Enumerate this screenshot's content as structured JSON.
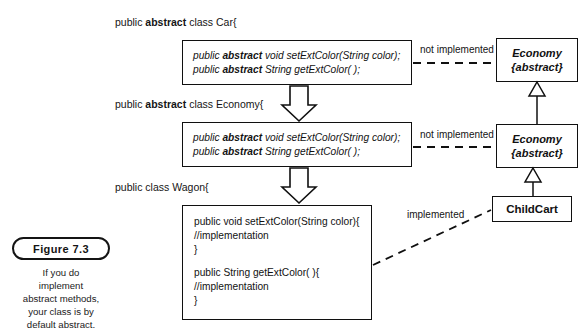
{
  "figure": {
    "badge_label": "Figure 7.3",
    "caption_lines": [
      "If you do",
      "implement",
      "abstract methods,",
      "your class is by",
      "default abstract."
    ]
  },
  "declarations": {
    "car": {
      "prefix": "public ",
      "keyword": "abstract",
      "suffix": " class Car{"
    },
    "economy": {
      "prefix": "public ",
      "keyword": "abstract",
      "suffix": " class Economy{"
    },
    "wagon": {
      "prefix": "public class Wagon{",
      "keyword": "",
      "suffix": ""
    }
  },
  "code_blocks": [
    {
      "id": "car-body",
      "lines": [
        {
          "pre": "public ",
          "bold": "abstract",
          "post": " void setExtColor(String color);"
        },
        {
          "pre": "public ",
          "bold": "abstract",
          "post": " String getExtColor( );"
        }
      ]
    },
    {
      "id": "economy-body",
      "lines": [
        {
          "pre": "public ",
          "bold": "abstract",
          "post": " void setExtColor(String color);"
        },
        {
          "pre": "public ",
          "bold": "abstract",
          "post": " String getExtColor( );"
        }
      ]
    },
    {
      "id": "wagon-body",
      "lines": [
        {
          "pre": "public void setExtColor(String color){",
          "bold": "",
          "post": ""
        },
        {
          "pre": "   //implementation",
          "bold": "",
          "post": ""
        },
        {
          "pre": "}",
          "bold": "",
          "post": ""
        },
        {
          "pre": "public String getExtColor( ){",
          "bold": "",
          "post": ""
        },
        {
          "pre": "   //implementation",
          "bold": "",
          "post": ""
        },
        {
          "pre": "}",
          "bold": "",
          "post": ""
        }
      ]
    }
  ],
  "uml_boxes": [
    {
      "id": "economy-top",
      "line1": "Economy",
      "line2": "{abstract}"
    },
    {
      "id": "economy-mid",
      "line1": "Economy",
      "line2": "{abstract}"
    },
    {
      "id": "childcart",
      "line1": "ChildCart",
      "line2": ""
    }
  ],
  "connectors": [
    {
      "id": "car-not-implemented",
      "label": "not implemented"
    },
    {
      "id": "economy-not-implemented",
      "label": "not implemented"
    },
    {
      "id": "wagon-implemented",
      "label": "implemented"
    }
  ],
  "colors": {
    "stroke": "#101010",
    "background": "#ffffff",
    "text": "#141414"
  }
}
